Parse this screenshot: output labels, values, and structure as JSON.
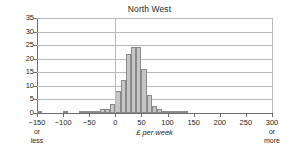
{
  "chart_data": {
    "type": "bar",
    "title": "North West",
    "xlabel": "£ per week",
    "ylabel": "",
    "xlim": [
      -150,
      300
    ],
    "ylim": [
      0,
      35
    ],
    "grid": true,
    "legend": null,
    "x_tick_labels": [
      "−150",
      "−100",
      "−50",
      "0",
      "50",
      "100",
      "150",
      "200",
      "250",
      "300"
    ],
    "x_tick_values": [
      -150,
      -100,
      -50,
      0,
      50,
      100,
      150,
      200,
      250,
      300
    ],
    "x_tick_sublabels": [
      "or less",
      "",
      "",
      "",
      "",
      "",
      "",
      "",
      "",
      "or more"
    ],
    "y_tick_labels": [
      "0",
      "5",
      "10",
      "15",
      "20",
      "25",
      "30",
      "35"
    ],
    "y_tick_values": [
      0,
      5,
      10,
      15,
      20,
      25,
      30,
      35
    ],
    "bin_width": 10,
    "categories": [
      -150,
      -140,
      -130,
      -120,
      -110,
      -100,
      -90,
      -80,
      -70,
      -60,
      -50,
      -40,
      -30,
      -20,
      -10,
      0,
      10,
      20,
      30,
      40,
      50,
      60,
      70,
      80,
      90,
      100,
      110,
      120,
      130,
      140,
      150,
      160,
      170,
      180,
      190,
      200,
      210,
      220,
      230,
      240,
      250,
      260,
      270,
      280,
      290
    ],
    "values": [
      0.1,
      0,
      0,
      0,
      0,
      0.1,
      0,
      0,
      0.3,
      0.3,
      0.5,
      0.8,
      1.4,
      1.6,
      3.2,
      8.0,
      12.0,
      21.7,
      24.2,
      24.2,
      16.2,
      6.8,
      2.7,
      1.5,
      0.4,
      0.4,
      0.3,
      0.1,
      0.1,
      0,
      0,
      0,
      0,
      0,
      0,
      0,
      0,
      0,
      0,
      0,
      0,
      0,
      0,
      0,
      0
    ],
    "bar_color": "#c6c6c6",
    "bar_edge_color": "#8a8a8a",
    "grid_color": "#b8b8b8",
    "axis_color": "#6d6e71"
  }
}
